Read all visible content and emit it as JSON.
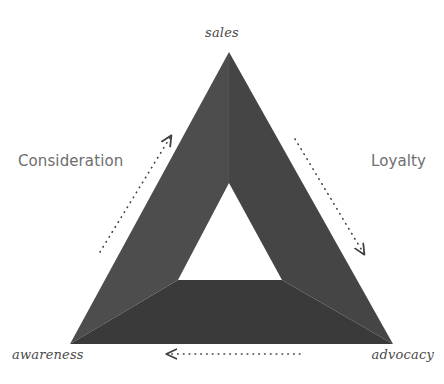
{
  "diagram": {
    "background_color": "#ffffff",
    "vertices": [
      {
        "id": "sales",
        "label": "sales",
        "position": "top",
        "x": 229,
        "y": 52
      },
      {
        "id": "awareness",
        "label": "awareness",
        "position": "bottom-left",
        "x": 70,
        "y": 344
      },
      {
        "id": "advocacy",
        "label": "advocacy",
        "position": "bottom-right",
        "x": 393,
        "y": 344
      }
    ],
    "sides": [
      {
        "id": "consideration",
        "label": "Consideration",
        "position": "left",
        "color": "#6e6e6e"
      },
      {
        "id": "loyalty",
        "label": "Loyalty",
        "position": "right",
        "color": "#6e6e6e"
      }
    ],
    "segments": [
      {
        "id": "left-segment",
        "from": "awareness",
        "to": "sales",
        "fill": "#4d4d4d"
      },
      {
        "id": "right-segment",
        "from": "sales",
        "to": "advocacy",
        "fill": "#454545"
      },
      {
        "id": "bottom-segment",
        "from": "advocacy",
        "to": "awareness",
        "fill": "#3a3a3a"
      }
    ],
    "inner_triangle": {
      "id": "inner-cutout",
      "fill": "#ffffff",
      "apex": {
        "x": 229,
        "y": 183
      },
      "bottom_left": {
        "x": 178,
        "y": 280
      },
      "bottom_right": {
        "x": 282,
        "y": 280
      }
    },
    "arrows": [
      {
        "id": "arrow-awareness-to-sales",
        "label": "",
        "direction": "up-right",
        "style": "dotted",
        "color": "#3f3f3f",
        "from": {
          "x": 100,
          "y": 252
        },
        "to": {
          "x": 171,
          "y": 136
        }
      },
      {
        "id": "arrow-sales-to-advocacy",
        "label": "",
        "direction": "down-right",
        "style": "dotted",
        "color": "#3f3f3f",
        "from": {
          "x": 295,
          "y": 139
        },
        "to": {
          "x": 364,
          "y": 254
        }
      },
      {
        "id": "arrow-advocacy-to-awareness",
        "label": "",
        "direction": "left",
        "style": "dotted",
        "color": "#3f3f3f",
        "from": {
          "x": 300,
          "y": 354
        },
        "to": {
          "x": 167,
          "y": 354
        }
      }
    ]
  }
}
